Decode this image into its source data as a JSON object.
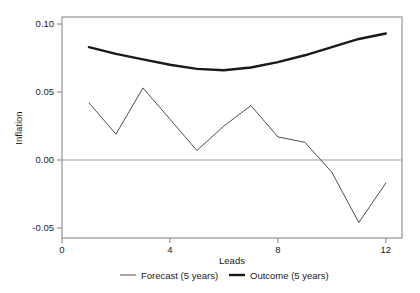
{
  "chart_data": {
    "type": "line",
    "title": "",
    "xlabel": "Leads",
    "ylabel": "Inflation",
    "x": [
      1,
      2,
      3,
      4,
      5,
      6,
      7,
      8,
      9,
      10,
      11,
      12
    ],
    "xlim": [
      0,
      12.6
    ],
    "ylim": [
      -0.05,
      0.1
    ],
    "xticks": [
      0,
      4,
      8,
      12
    ],
    "xtick_labels": [
      "0",
      "4",
      "8",
      "12"
    ],
    "yticks": [
      -0.05,
      0.0,
      0.05,
      0.1
    ],
    "ytick_labels": [
      "-0.05",
      "0.00",
      "0.05",
      "0.10"
    ],
    "grid": false,
    "zero_line": true,
    "legend_position": "bottom",
    "series": [
      {
        "name": "Forecast (5 years)",
        "color": "#4d4d4d",
        "width": 1.0,
        "values": [
          0.042,
          0.019,
          0.053,
          0.03,
          0.007,
          0.025,
          0.04,
          0.017,
          0.013,
          -0.009,
          -0.046,
          -0.017
        ]
      },
      {
        "name": "Outcome (5 years)",
        "color": "#1a1a1a",
        "width": 2.4,
        "values": [
          0.083,
          0.078,
          0.074,
          0.07,
          0.067,
          0.066,
          0.068,
          0.072,
          0.077,
          0.083,
          0.089,
          0.093
        ]
      }
    ]
  },
  "legend": {
    "items": [
      {
        "label": "Forecast (5 years)"
      },
      {
        "label": "Outcome (5 years)"
      }
    ]
  },
  "axes": {
    "x_title": "Leads",
    "y_title": "Inflation"
  }
}
